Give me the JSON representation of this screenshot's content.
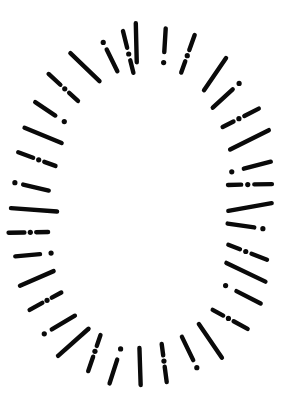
{
  "drawing": {
    "background": "#ffffff",
    "ink": "#0a0a0a",
    "canvas": {
      "width": 284,
      "height": 415
    },
    "ellipse": {
      "cx": 142,
      "cy": 207,
      "inner_rx": 86,
      "inner_ry": 142,
      "outer_rx": 130,
      "outer_ry": 181
    },
    "stroke_width": 4.4,
    "dot_radius": 2.6,
    "patterns": {
      "dash": [
        [
          "dash",
          0,
          1
        ]
      ],
      "dot-dash": [
        [
          "dot",
          0.03
        ],
        [
          "dash",
          0.33,
          1
        ]
      ],
      "dash-dot": [
        [
          "dash",
          0,
          0.68
        ],
        [
          "dot",
          0.9
        ]
      ],
      "dash-dot-dash": [
        [
          "dash",
          0,
          0.3
        ],
        [
          "dot",
          0.45
        ],
        [
          "dash",
          0.6,
          1
        ]
      ]
    },
    "spokes": [
      {
        "deg": -3,
        "type": "dash",
        "rot": 2,
        "len": 1.0,
        "rad": 3
      },
      {
        "deg": 12,
        "type": "dot-dash",
        "rot": -10,
        "len": 0.9,
        "rad": 3
      },
      {
        "deg": 24,
        "type": "dash-dot-dash",
        "rot": -7,
        "len": 1.0,
        "rad": 6
      },
      {
        "deg": 39,
        "type": "dash",
        "rot": -8,
        "len": 0.95,
        "rad": 9
      },
      {
        "deg": 48,
        "type": "dash-dot",
        "rot": -4,
        "len": 0.95,
        "rad": 7
      },
      {
        "deg": 58,
        "type": "dash-dot-dash",
        "rot": 2,
        "len": 0.95,
        "rad": 8
      },
      {
        "deg": 67,
        "type": "dash",
        "rot": -6,
        "len": 1.0,
        "rad": 9
      },
      {
        "deg": 76,
        "type": "dot-dash",
        "rot": -2,
        "len": 0.95,
        "rad": 4
      },
      {
        "deg": 82,
        "type": "dash-dot-dash",
        "rot": 6,
        "len": 1.0,
        "rad": 1
      },
      {
        "deg": 90,
        "type": "dash",
        "rot": -10,
        "len": 1.0,
        "rad": 0
      },
      {
        "deg": 97,
        "type": "dash-dot",
        "rot": 2,
        "len": 0.9,
        "rad": -2
      },
      {
        "deg": 106,
        "type": "dash-dot-dash",
        "rot": 7,
        "len": 0.95,
        "rad": 2
      },
      {
        "deg": 113,
        "type": "dash",
        "rot": 5,
        "len": 1.0,
        "rad": 5
      },
      {
        "deg": 121,
        "type": "dot-dash",
        "rot": -1,
        "len": 0.95,
        "rad": 9
      },
      {
        "deg": 132,
        "type": "dash-dot-dash",
        "rot": -10,
        "len": 0.95,
        "rad": 9
      },
      {
        "deg": 143,
        "type": "dash",
        "rot": 6,
        "len": 1.0,
        "rad": 6
      },
      {
        "deg": 154,
        "type": "dash-dot",
        "rot": 3,
        "len": 0.95,
        "rad": 2
      },
      {
        "deg": 168,
        "type": "dash-dot-dash",
        "rot": 6,
        "len": 0.98,
        "rad": -2
      },
      {
        "deg": 181,
        "type": "dash",
        "rot": -3,
        "len": 0.95,
        "rad": -2
      },
      {
        "deg": 194,
        "type": "dot-dash",
        "rot": 2,
        "len": 0.95,
        "rad": 2
      },
      {
        "deg": 206,
        "type": "dash-dot-dash",
        "rot": -10,
        "len": 0.95,
        "rad": 1
      },
      {
        "deg": 216,
        "type": "dash",
        "rot": 9,
        "len": 1.0,
        "rad": 7
      },
      {
        "deg": 225,
        "type": "dash-dot",
        "rot": 11,
        "len": 0.95,
        "rad": 9
      },
      {
        "deg": 236,
        "type": "dash-dot-dash",
        "rot": 2,
        "len": 0.85,
        "rad": 8
      },
      {
        "deg": 245,
        "type": "dash",
        "rot": -1,
        "len": 0.85,
        "rad": 8
      },
      {
        "deg": 253,
        "type": "dot-dash",
        "rot": 10,
        "len": 0.85,
        "rad": 5
      },
      {
        "deg": 261,
        "type": "dash-dot-dash",
        "rot": 7,
        "len": 0.9,
        "rad": 7
      },
      {
        "deg": 269,
        "type": "dash",
        "rot": 5,
        "len": 1.05,
        "rad": 0
      },
      {
        "deg": 277,
        "type": "dash-dot",
        "rot": 7,
        "len": 0.88,
        "rad": 5
      },
      {
        "deg": 287,
        "type": "dash-dot-dash",
        "rot": 5,
        "len": 0.91,
        "rad": 2
      },
      {
        "deg": 296,
        "type": "dash",
        "rot": -1,
        "len": 0.93,
        "rad": 2
      },
      {
        "deg": 305,
        "type": "dot-dash",
        "rot": 2,
        "len": 0.85,
        "rad": 4
      },
      {
        "deg": 316,
        "type": "dash-dot-dash",
        "rot": 0,
        "len": 0.96,
        "rad": 5
      },
      {
        "deg": 329,
        "type": "dash",
        "rot": -12,
        "len": 1.0,
        "rad": 2
      },
      {
        "deg": 342,
        "type": "dash-dot",
        "rot": -6,
        "len": 0.9,
        "rad": -2
      },
      {
        "deg": 352,
        "type": "dash-dot-dash",
        "rot": -5,
        "len": 1.1,
        "rad": -5
      }
    ]
  }
}
